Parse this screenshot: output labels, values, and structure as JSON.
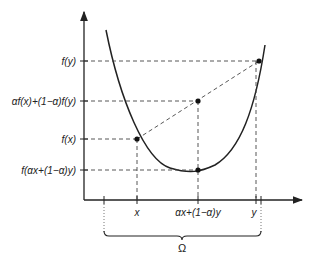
{
  "diagram": {
    "y_labels": {
      "fy": "f(y)",
      "combo": "αf(x)+(1−α)f(y)",
      "fx": "f(x)",
      "f_combo": "f(αx+(1−α)y)"
    },
    "x_labels": {
      "x": "x",
      "combo": "αx+(1−α)y",
      "y": "y"
    },
    "domain_label": "Ω",
    "colors": {
      "stroke": "#222222",
      "dash": "#444444"
    }
  }
}
